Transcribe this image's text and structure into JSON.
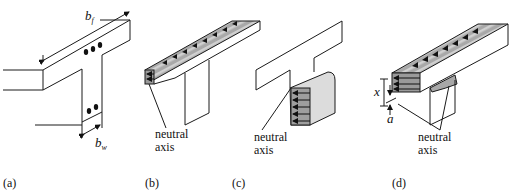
{
  "figure": {
    "panels": [
      {
        "id": "a",
        "label": "(a)",
        "description": "T-beam cross-section with flange and web, reinforcement bars",
        "dimensions": {
          "flange_width": "b",
          "flange_sub": "f",
          "web_width": "b",
          "web_sub": "w"
        }
      },
      {
        "id": "b",
        "label": "(b)",
        "description": "Neutral axis within the flange; compression block in flange",
        "annotation": "neutral\naxis",
        "annotation_line1": "neutral",
        "annotation_line2": "axis"
      },
      {
        "id": "c",
        "label": "(c)",
        "description": "Inverted T / compression in web region",
        "annotation_line1": "neutral",
        "annotation_line2": "axis"
      },
      {
        "id": "d",
        "label": "(d)",
        "description": "Neutral axis below flange; stress block depth a vs neutral axis depth x",
        "dimensions": {
          "x": "x",
          "a": "a"
        },
        "annotation_line1": "neutral",
        "annotation_line2": "axis"
      }
    ],
    "colors": {
      "line": "#1a1a1a",
      "hatch_fill": "#9a9a9a",
      "hatch_stripe": "#c8c8c8",
      "web_fill": "#d9d9d9",
      "arrow": "#111111"
    }
  }
}
